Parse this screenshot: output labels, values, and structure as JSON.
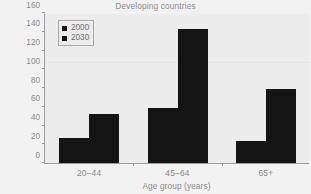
{
  "chart_data": {
    "type": "bar",
    "title": "Developing countries",
    "xlabel": "Age group (years)",
    "ylabel": "Estimated numbers of people with diabetes (millions)",
    "ylabel_lines": [
      "Estimated numbers of people",
      "with diabetes (millions)"
    ],
    "categories": [
      "20–44",
      "45–64",
      "65+"
    ],
    "series": [
      {
        "name": "2000",
        "values": [
          27,
          59,
          24
        ],
        "color": "#141414"
      },
      {
        "name": "2030",
        "values": [
          52,
          143,
          79
        ],
        "color": "#141414"
      }
    ],
    "ylim": [
      0,
      160
    ],
    "ytick_labels": [
      "0",
      "20",
      "40",
      "60",
      "80",
      "100",
      "120",
      "140",
      "160"
    ],
    "ytick_values": [
      0,
      20,
      40,
      60,
      80,
      100,
      120,
      140,
      160
    ],
    "grid": "faint-horizontal",
    "gridline_values": [
      107
    ],
    "legend_position": "upper-left-inside",
    "plot_background": "#ececec",
    "figure_background": "#f2f2f2",
    "axis_color": "#9d9d9d",
    "text_color": "#8a8a8a"
  },
  "legend": {
    "entries": [
      {
        "label": "2000"
      },
      {
        "label": "2030"
      }
    ]
  }
}
